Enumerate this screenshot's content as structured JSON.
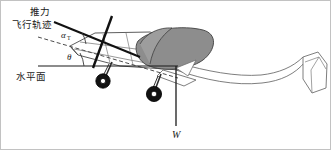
{
  "figure": {
    "background_color": "#ffffff",
    "frame_color": "#b9b9b9",
    "width": 331,
    "height": 150
  },
  "labels": {
    "thrust": "推力",
    "flight_path": "飞行轨迹",
    "horizontal_plane": "水平面",
    "alpha": "α",
    "alpha_subscript": "T",
    "theta": "θ",
    "weight": "W"
  },
  "colors": {
    "outline": "#4a4a4a",
    "heavy_line": "#111111",
    "wing_fill": "#8d8d8d",
    "wing_stroke": "#3a3a3a",
    "canopy_fill": "#9a9a9a",
    "wheel_tire": "#141414",
    "wheel_hub": "#ffffff",
    "dashed_line": "#555555",
    "text": "#1a1a1a"
  },
  "geometry": {
    "thrust_line": {
      "x1": 54,
      "y1": 23,
      "x2": 136,
      "y2": 55
    },
    "flight_path_dashed": {
      "x1": 38,
      "y1": 37,
      "x2": 175,
      "y2": 76
    },
    "horizontal_line": {
      "x1": 38,
      "y1": 66,
      "x2": 176,
      "y2": 66
    },
    "weight_line": {
      "x1": 176,
      "y1": 68,
      "x2": 176,
      "y2": 127
    },
    "propeller_line": {
      "x1": 110,
      "y1": 18,
      "x2": 94,
      "y2": 66
    },
    "alpha_arc_label_pos": {
      "x": 67,
      "y": 36
    },
    "theta_arc_label_pos": {
      "x": 72,
      "y": 58
    }
  },
  "annotations": [
    {
      "name": "thrust",
      "text": "推力",
      "x": 30,
      "y": 12
    },
    {
      "name": "flight-path",
      "text": "飞行轨迹",
      "x": 13,
      "y": 25
    },
    {
      "name": "horizontal-plane",
      "text": "水平面",
      "x": 16,
      "y": 78
    },
    {
      "name": "weight",
      "text": "W",
      "x": 172,
      "y": 138
    }
  ]
}
